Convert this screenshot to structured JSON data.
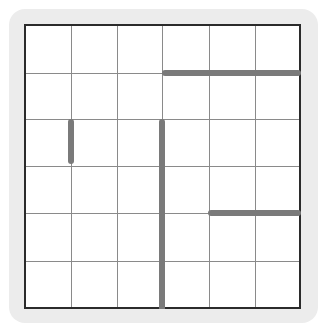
{
  "game": {
    "type": "grid-puzzle",
    "rows": 6,
    "cols": 6,
    "colors": {
      "panel": "#ececec",
      "board": "#ffffff",
      "border": "#2b2b2b",
      "gridline": "#8a8a8a",
      "wall": "#7a7a7a"
    },
    "walls": [
      {
        "id": "wall-1",
        "orientation": "horizontal",
        "row_line": 1,
        "from_col": 3,
        "to_col": 6
      },
      {
        "id": "wall-2",
        "orientation": "vertical",
        "col_line": 1,
        "from_row": 2,
        "to_row": 3
      },
      {
        "id": "wall-3",
        "orientation": "vertical",
        "col_line": 3,
        "from_row": 2,
        "to_row": 6
      },
      {
        "id": "wall-4",
        "orientation": "horizontal",
        "row_line": 4,
        "from_col": 4,
        "to_col": 6
      }
    ]
  }
}
